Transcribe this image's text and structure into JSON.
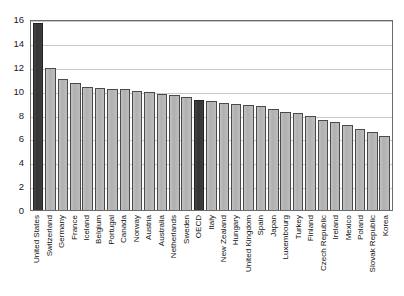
{
  "chart_data": {
    "type": "bar",
    "title": "",
    "subtitle": "",
    "xlabel": "",
    "ylabel": "",
    "ylim": [
      0,
      16
    ],
    "ytick_labels": [
      "0",
      "2",
      "4",
      "6",
      "8",
      "10",
      "12",
      "14",
      "16"
    ],
    "ytick_values": [
      0,
      2,
      4,
      6,
      8,
      10,
      12,
      14,
      16
    ],
    "grid": true,
    "gridlines_at": [
      2,
      4,
      6,
      8,
      10,
      12,
      14,
      16
    ],
    "legend": [],
    "highlight_color": "#3a3a3a",
    "bar_color": "#b8b8b8",
    "bar_edge_color": "#4a4a4a",
    "highlighted_categories": [
      "United States",
      "OECD"
    ],
    "categories": [
      "United States",
      "Switzerland",
      "Germany",
      "France",
      "Iceland",
      "Belgium",
      "Portugal",
      "Canada",
      "Norway",
      "Austria",
      "Australia",
      "Netherlands",
      "Sweden",
      "OECD",
      "Italy",
      "New Zealand",
      "Hungary",
      "United Kingdom",
      "Spain",
      "Japan",
      "Luxembourg",
      "Turkey",
      "Finland",
      "Czech Republic",
      "Ireland",
      "Mexico",
      "Poland",
      "Slovak Republic",
      "Korea"
    ],
    "values": [
      15.7,
      11.9,
      11.0,
      10.6,
      10.3,
      10.2,
      10.1,
      10.1,
      10.0,
      9.9,
      9.7,
      9.6,
      9.5,
      9.2,
      9.1,
      9.0,
      8.9,
      8.8,
      8.7,
      8.5,
      8.2,
      8.1,
      7.9,
      7.5,
      7.4,
      7.1,
      6.8,
      6.5,
      6.2
    ]
  }
}
